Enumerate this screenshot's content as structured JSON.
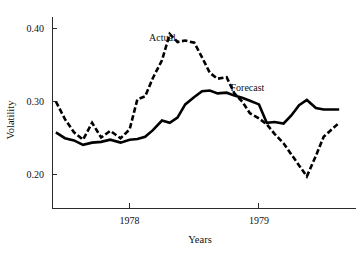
{
  "chart_data": {
    "type": "line",
    "title": "",
    "xlabel": "Years",
    "ylabel": "Volatility",
    "xlim": [
      1977.4,
      1979.75
    ],
    "ylim": [
      0.155,
      0.415
    ],
    "grid": false,
    "legend_position": "inline-annotation",
    "x_tick_labels": [
      "1978",
      "1979"
    ],
    "x_tick_values": [
      1978,
      1979
    ],
    "y_tick_labels": [
      "0.20",
      "0.30",
      "0.40"
    ],
    "y_tick_values": [
      0.2,
      0.3,
      0.4
    ],
    "annotations": [
      {
        "text": "Actual",
        "x": 1978.15,
        "y": 0.383
      },
      {
        "text": "Forecast",
        "x": 1978.78,
        "y": 0.314
      }
    ],
    "series": [
      {
        "name": "Actual",
        "style": "dashed",
        "color": "#000000",
        "x": [
          1977.43,
          1977.5,
          1977.57,
          1977.64,
          1977.71,
          1977.78,
          1977.85,
          1977.93,
          1978.0,
          1978.06,
          1978.12,
          1978.18,
          1978.25,
          1978.31,
          1978.37,
          1978.43,
          1978.5,
          1978.56,
          1978.62,
          1978.68,
          1978.75,
          1978.81,
          1978.87,
          1978.93,
          1979.0,
          1979.06,
          1979.12,
          1979.19,
          1979.25,
          1979.31,
          1979.37,
          1979.44,
          1979.5,
          1979.62
        ],
        "values": [
          0.3,
          0.276,
          0.258,
          0.248,
          0.271,
          0.251,
          0.26,
          0.25,
          0.262,
          0.303,
          0.307,
          0.332,
          0.356,
          0.392,
          0.381,
          0.383,
          0.38,
          0.36,
          0.339,
          0.331,
          0.333,
          0.311,
          0.3,
          0.284,
          0.277,
          0.269,
          0.256,
          0.243,
          0.228,
          0.213,
          0.198,
          0.226,
          0.252,
          0.271
        ]
      },
      {
        "name": "Forecast",
        "style": "solid",
        "color": "#000000",
        "x": [
          1977.43,
          1977.5,
          1977.57,
          1977.64,
          1977.71,
          1977.78,
          1977.85,
          1977.93,
          1978.0,
          1978.06,
          1978.12,
          1978.18,
          1978.25,
          1978.31,
          1978.37,
          1978.43,
          1978.5,
          1978.56,
          1978.62,
          1978.68,
          1978.75,
          1978.81,
          1978.87,
          1978.93,
          1979.0,
          1979.06,
          1979.12,
          1979.19,
          1979.25,
          1979.31,
          1979.37,
          1979.44,
          1979.5,
          1979.62
        ],
        "values": [
          0.258,
          0.25,
          0.247,
          0.241,
          0.244,
          0.245,
          0.248,
          0.244,
          0.248,
          0.249,
          0.252,
          0.261,
          0.274,
          0.271,
          0.278,
          0.296,
          0.306,
          0.314,
          0.315,
          0.311,
          0.312,
          0.308,
          0.305,
          0.301,
          0.296,
          0.271,
          0.272,
          0.27,
          0.281,
          0.295,
          0.302,
          0.291,
          0.289,
          0.289
        ]
      }
    ]
  }
}
